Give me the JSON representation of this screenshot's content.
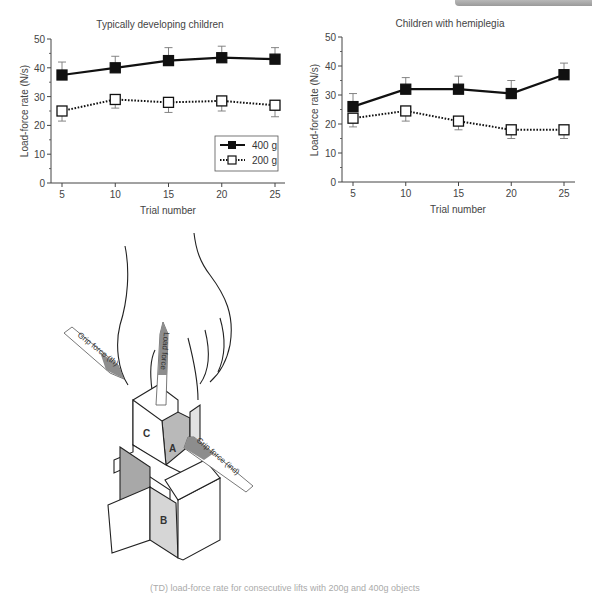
{
  "chart_data": [
    {
      "type": "line",
      "title": "Typically developing children",
      "xlabel": "Trial number",
      "ylabel": "Load-force rate (N/s)",
      "x": [
        5,
        10,
        15,
        20,
        25
      ],
      "ylim": [
        0,
        50
      ],
      "yticks": [
        0,
        10,
        20,
        30,
        40,
        50
      ],
      "grid": false,
      "legend_position": "lower right",
      "series": [
        {
          "name": "400 g",
          "marker": "filled-square",
          "line": "solid",
          "values": [
            37.5,
            40,
            42.5,
            43.5,
            43
          ],
          "error_upper": [
            42,
            44,
            47,
            47.5,
            47
          ]
        },
        {
          "name": "200 g",
          "marker": "open-square",
          "line": "dotted",
          "values": [
            25,
            29,
            28,
            28.5,
            27
          ],
          "error_lower": [
            21.5,
            26,
            24.5,
            25,
            23
          ]
        }
      ]
    },
    {
      "type": "line",
      "title": "Children with hemiplegia",
      "xlabel": "Trial number",
      "ylabel": "Load-force rate (N/s)",
      "x": [
        5,
        10,
        15,
        20,
        25
      ],
      "ylim": [
        0,
        50
      ],
      "yticks": [
        0,
        10,
        20,
        30,
        40,
        50
      ],
      "grid": false,
      "series": [
        {
          "name": "400 g",
          "marker": "filled-square",
          "line": "solid",
          "values": [
            26,
            32,
            32,
            30.5,
            37
          ],
          "error_upper": [
            30.5,
            36,
            36.5,
            35,
            41
          ]
        },
        {
          "name": "200 g",
          "marker": "open-square",
          "line": "dotted",
          "values": [
            22,
            24.5,
            21,
            18,
            18
          ],
          "error_lower": [
            19,
            21,
            18,
            15,
            15
          ]
        }
      ]
    }
  ],
  "charts": {
    "left": {
      "title": "Typically developing children",
      "ylabel": "Load-force rate (N/s)",
      "xlabel": "Trial number"
    },
    "right": {
      "title": "Children with hemiplegia",
      "ylabel": "Load-force rate (N/s)",
      "xlabel": "Trial number"
    },
    "legend": {
      "s1": "400 g",
      "s2": "200 g"
    },
    "yticks": [
      "0",
      "10",
      "20",
      "30",
      "40",
      "50"
    ],
    "xticks": [
      "5",
      "10",
      "15",
      "20",
      "25"
    ]
  },
  "diagram": {
    "labels": {
      "grip_th": "Grip force (th)",
      "load": "Load force",
      "grip_ind": "Grip force (ind)",
      "a": "A",
      "b": "B",
      "c": "C"
    }
  },
  "caption": "(TD) load-force rate for consecutive lifts with 200g and 400g objects"
}
